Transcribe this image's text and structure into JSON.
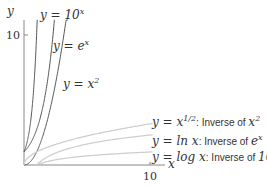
{
  "chart_data": {
    "type": "line",
    "title": "",
    "xlabel": "x",
    "ylabel": "y",
    "xlim": [
      0,
      11.5
    ],
    "ylim": [
      0,
      12.5
    ],
    "x_ticks": [
      "10"
    ],
    "y_ticks": [
      "10"
    ],
    "grid": false,
    "series": [
      {
        "name": "y = 10^x",
        "label": "y = 10",
        "sup": "x",
        "color": "#555555",
        "fn": "pow10"
      },
      {
        "name": "y = e^x",
        "label": "y = e",
        "sup": "x",
        "color": "#555555",
        "fn": "exp"
      },
      {
        "name": "y = x^2",
        "label": "y = x",
        "sup": "2",
        "color": "#555555",
        "fn": "sq"
      },
      {
        "name": "y = x^(1/2): Inverse of x^2",
        "label": "y = x",
        "sup": "1/2",
        "suffix": ": Inverse of ",
        "suffix_math": "x",
        "suffix_sup": "2",
        "color": "#cccccc",
        "fn": "sqrt"
      },
      {
        "name": "y = ln x: Inverse of e^x",
        "label": "y = ln x",
        "suffix": ": Inverse of ",
        "suffix_math": "e",
        "suffix_sup": "x",
        "color": "#cccccc",
        "fn": "ln"
      },
      {
        "name": "y = log x: Inverse of 10^x",
        "label": "y = log x",
        "suffix": ": Inverse of ",
        "suffix_math": "10",
        "suffix_sup": "x",
        "color": "#cccccc",
        "fn": "log10"
      }
    ]
  },
  "labels": {
    "y_axis": "y",
    "x_axis": "x",
    "x_tick_10": "10",
    "y_tick_10": "10",
    "pow10_main": "y = 10",
    "pow10_sup": "x",
    "exp_main": "y = e",
    "exp_sup": "x",
    "sq_main": "y = x",
    "sq_sup": "2",
    "sqrt_main": "y = x",
    "sqrt_sup": "1/2",
    "sqrt_suffix": ": Inverse of ",
    "sqrt_suffix_math": "x",
    "sqrt_suffix_sup": "2",
    "ln_main": "y = ln x",
    "ln_suffix": ": Inverse of ",
    "ln_suffix_math": "e",
    "ln_suffix_sup": "x",
    "log_main": "y = log x",
    "log_suffix": ": Inverse of ",
    "log_suffix_math": "10",
    "log_suffix_sup": "x"
  }
}
